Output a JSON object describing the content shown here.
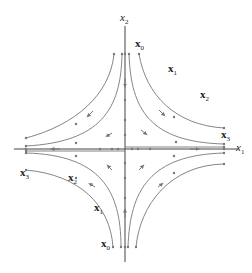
{
  "figure": {
    "type": "phase portrait (saddle point)",
    "axes": {
      "x_label": "x",
      "x_sub": "1",
      "y_label": "x",
      "y_sub": "2"
    },
    "point_labels": [
      {
        "id": "top-x0",
        "base": "x",
        "sub": "0",
        "x": 135,
        "y": 38
      },
      {
        "id": "top-x1",
        "base": "x",
        "sub": "1",
        "x": 168,
        "y": 63
      },
      {
        "id": "top-x2",
        "base": "x",
        "sub": "2",
        "x": 200,
        "y": 89
      },
      {
        "id": "top-x3",
        "base": "x",
        "sub": "3",
        "x": 221,
        "y": 129
      },
      {
        "id": "bot-x3",
        "base": "x",
        "sub": "3",
        "x": 20,
        "y": 167
      },
      {
        "id": "bot-x2",
        "base": "x",
        "sub": "2",
        "x": 68,
        "y": 172
      },
      {
        "id": "bot-x1",
        "base": "x",
        "sub": "1",
        "x": 94,
        "y": 202
      },
      {
        "id": "bot-x0",
        "base": "x",
        "sub": "0",
        "x": 101,
        "y": 238
      }
    ],
    "colors": {
      "axis": "#444444",
      "curve": "#777777",
      "text": "#222222"
    }
  }
}
